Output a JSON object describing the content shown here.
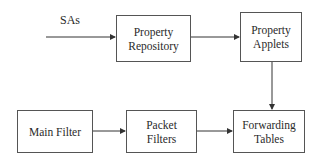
{
  "diagram": {
    "input_label": "SAs",
    "nodes": [
      {
        "id": "property-repository",
        "line1": "Property",
        "line2": "Repository"
      },
      {
        "id": "property-applets",
        "line1": "Property",
        "line2": "Applets"
      },
      {
        "id": "main-filter",
        "line1": "Main Filter",
        "line2": ""
      },
      {
        "id": "packet-filters",
        "line1": "Packet",
        "line2": "Filters"
      },
      {
        "id": "forwarding-tables",
        "line1": "Forwarding",
        "line2": "Tables"
      }
    ],
    "edges": [
      {
        "from": "SAs",
        "to": "property-repository"
      },
      {
        "from": "property-repository",
        "to": "property-applets"
      },
      {
        "from": "property-applets",
        "to": "forwarding-tables"
      },
      {
        "from": "main-filter",
        "to": "packet-filters"
      },
      {
        "from": "packet-filters",
        "to": "forwarding-tables"
      }
    ]
  }
}
